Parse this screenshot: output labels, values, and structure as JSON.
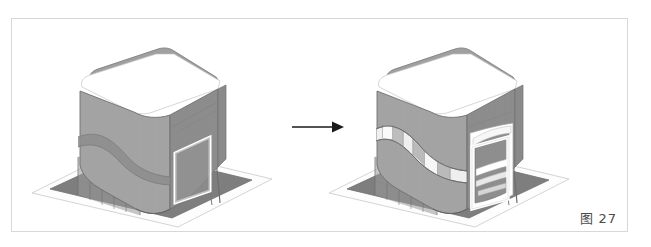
{
  "figure": {
    "caption_label": "图",
    "caption_number": "27",
    "caption_full": "图 27",
    "frame_border_color": "#d8d8d8",
    "background_color": "#ffffff"
  },
  "arrow": {
    "name": "transformation-arrow",
    "direction": "right",
    "color": "#1a1a1a"
  },
  "panels": [
    {
      "id": "before",
      "title": "Massing study - original volume",
      "description": "Axonometric 3D rendering of a rounded-corner rectangular building volume on a plinth, showing a plain facade with one white-framed square window and a diagonal shadow band.",
      "features": [
        "rounded-corner roof slab",
        "white fascia band under roof",
        "plain gridded curtain-wall facade",
        "single white-framed square window",
        "diagonal recessed shadow band",
        "open ground-floor pilotis with glazed lobby",
        "dark gray plaza deck",
        "white site boundary plane"
      ],
      "colors": {
        "roof": "#9d9d9d",
        "front_facade": "#a2a2a2",
        "side_facade": "#8b8b8b",
        "shadow_band": "#8a8a8a",
        "plaza": "#7e7e7e",
        "site_plane": "#fcfcfc",
        "window_frame": "#ffffff",
        "outline": "#6a6a6a"
      }
    },
    {
      "id": "after",
      "title": "Massing study - facade openings added",
      "description": "Same axonometric 3D rendering with the facade modified: a long diagonal ribbon window cut into the left face and a large white-framed recessed opening with horizontal floor slabs on the front face.",
      "features": [
        "rounded-corner roof slab",
        "white fascia band under roof",
        "diagonal ribbon window with glazed segments",
        "large white-framed recessed opening",
        "stacked horizontal floor slabs inside opening",
        "open ground-floor pilotis with glazed lobby",
        "dark gray plaza deck",
        "white site boundary plane"
      ],
      "colors": {
        "roof": "#9d9d9d",
        "front_facade": "#a2a2a2",
        "side_facade": "#8b8b8b",
        "ribbon_window": "#f2f2f2",
        "opening_frame": "#ffffff",
        "opening_recess": "#8a8a8a",
        "plaza": "#7e7e7e",
        "site_plane": "#fcfcfc",
        "outline": "#6a6a6a"
      }
    }
  ]
}
